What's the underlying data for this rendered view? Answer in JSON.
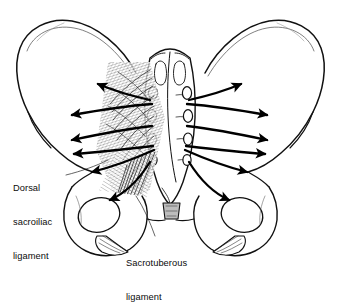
{
  "figure": {
    "style": "black and white anatomical line drawing",
    "background_color": "#ffffff",
    "ink_color": "#111111"
  },
  "labels": {
    "dorsal": {
      "line1": "Dorsal",
      "line2": "sacroiliac",
      "line3": "ligament",
      "full": "Dorsal sacroiliac ligament"
    },
    "sacrotuberous": {
      "line1": "Sacrotuberous",
      "line2": "ligament",
      "full": "Sacrotuberous ligament"
    }
  },
  "structures": [
    {
      "name": "left-ilium",
      "side": "left"
    },
    {
      "name": "right-ilium",
      "side": "right"
    },
    {
      "name": "sacrum",
      "side": "center"
    },
    {
      "name": "coccyx",
      "side": "center"
    },
    {
      "name": "left-obturator-foramen",
      "side": "left"
    },
    {
      "name": "right-obturator-foramen",
      "side": "right"
    },
    {
      "name": "left-ischial-tuberosity",
      "side": "left"
    },
    {
      "name": "right-ischial-tuberosity",
      "side": "right"
    },
    {
      "name": "sacral-foramina",
      "count": 8
    }
  ],
  "force_arrows": {
    "left_count": 6,
    "right_count": 6,
    "description": "force vectors radiating outward and downward from the sacral foramina through each ilium"
  }
}
